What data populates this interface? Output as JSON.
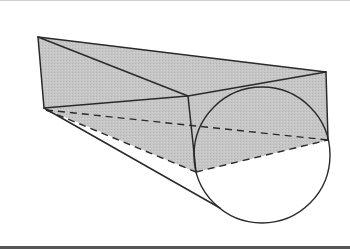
{
  "figure": {
    "colors": {
      "background": "#ffffff",
      "shade": "#c4c4c4",
      "stroke": "#2a2a2a",
      "top_rule": "#d0d0d0",
      "bottom_rule": "#555555"
    },
    "points": {
      "A": [
        38,
        37
      ],
      "B": [
        44,
        108
      ],
      "C": [
        326,
        72
      ],
      "D": [
        328,
        140
      ],
      "E": [
        188,
        96
      ],
      "F": [
        196,
        172
      ],
      "T": [
        220,
        208
      ]
    },
    "circle": {
      "cx": 262,
      "cy": 155,
      "r": 68
    }
  }
}
